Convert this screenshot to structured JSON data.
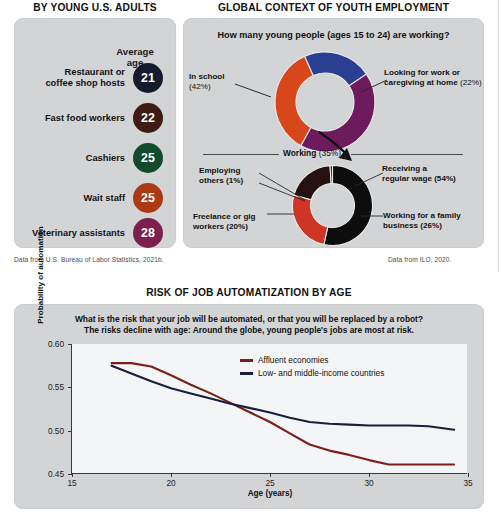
{
  "panels": {
    "left": {
      "title": "BY YOUNG U.S. ADULTS",
      "column_header": "Average\nage",
      "column_header_line1": "Average",
      "column_header_line2": "age",
      "rows": [
        {
          "label": "Restaurant or coffee shop hosts",
          "label_line1": "Restaurant or",
          "label_line2": "coffee shop hosts",
          "age": "21",
          "color": "#161a2e"
        },
        {
          "label": "Fast food workers",
          "label_line1": "Fast food workers",
          "label_line2": "",
          "age": "22",
          "color": "#3d1c12"
        },
        {
          "label": "Cashiers",
          "label_line1": "Cashiers",
          "label_line2": "",
          "age": "25",
          "color": "#124a2b"
        },
        {
          "label": "Wait staff",
          "label_line1": "Wait staff",
          "label_line2": "",
          "age": "25",
          "color": "#ab3a14"
        },
        {
          "label": "Veterinary assistants",
          "label_line1": "Veterinary assistants",
          "label_line2": "",
          "age": "28",
          "color": "#7c1f4d"
        }
      ],
      "source": "Data from U.S. Bureau of Labor Statistics, 2021b."
    },
    "right": {
      "title": "GLOBAL CONTEXT OF YOUTH EMPLOYMENT",
      "question": "How many young people (ages 15 to 24) are working?",
      "source": "Data from ILO, 2020.",
      "connector_label_bold": "Working",
      "connector_label_pct": "(35%)",
      "donut_top": {
        "type": "pie",
        "title": "How many young people (ages 15 to 24) are working?",
        "slices": [
          {
            "label": "In school",
            "pct_text": "(42%)",
            "value": 42,
            "color": "#6d1b5c"
          },
          {
            "label": "Looking for work or caregiving at home",
            "pct_text": "(22%)",
            "value": 22,
            "color": "#2b3f92"
          },
          {
            "label": "Working",
            "pct_text": "(35%)",
            "value": 35,
            "color": "#d8471b"
          }
        ]
      },
      "donut_bottom": {
        "type": "pie",
        "title": "Working (35%)",
        "slices": [
          {
            "label": "Receiving a regular wage",
            "pct_text": "(54%)",
            "value": 54,
            "color": "#0d0d0d"
          },
          {
            "label": "Working for a family business",
            "pct_text": "(26%)",
            "value": 26,
            "color": "#cf3525"
          },
          {
            "label": "Freelance or gig workers",
            "pct_text": "(20%)",
            "value": 20,
            "color": "#241210"
          },
          {
            "label": "Employing others",
            "pct_text": "(1%)",
            "value": 1,
            "color": "#5a1a14"
          }
        ]
      },
      "labels": {
        "in_school_l1": "In school",
        "in_school_l2": "(42%)",
        "looking_l1": "Looking for work or",
        "looking_l2": "caregiving at home",
        "looking_pct": "(22%)",
        "employing_l1": "Employing",
        "employing_l2": "others (1%)",
        "receiving_l1": "Receiving a",
        "receiving_l2": "regular wage (54%)",
        "freelance_l1": "Freelance or gig",
        "freelance_l2": "workers (20%)",
        "family_l1": "Working for a family",
        "family_l2": "business (26%)"
      }
    },
    "bottom": {
      "title": "RISK OF JOB AUTOMATIZATION BY AGE",
      "subtitle_line1": "What is the risk that your job will be automated, or that you will be replaced by a robot?",
      "subtitle_line2": "The risks decline with age: Around the globe, young people's jobs are most at risk."
    }
  },
  "chart_data": {
    "type": "line",
    "title": "RISK OF JOB AUTOMATIZATION BY AGE",
    "subtitle": "What is the risk that your job will be automated, or that you will be replaced by a robot? The risks decline with age: Around the globe, young people's jobs are most at risk.",
    "xlabel": "Age (years)",
    "ylabel": "Probability of automation",
    "xlim": [
      15,
      35
    ],
    "ylim": [
      0.45,
      0.6
    ],
    "xticks": [
      15,
      20,
      25,
      30,
      35
    ],
    "xtick_labels": [
      "15",
      "20",
      "25",
      "30",
      "35"
    ],
    "yticks": [
      0.45,
      0.5,
      0.55,
      0.6
    ],
    "ytick_labels": [
      "0.45",
      "0.50",
      "0.55",
      "0.60"
    ],
    "grid": false,
    "legend_position": "upper right",
    "series": [
      {
        "name": "Affluent economies",
        "color": "#7a2018",
        "x": [
          17.0,
          18.0,
          19.0,
          20.0,
          21.0,
          22.0,
          23.0,
          24.0,
          25.0,
          26.0,
          27.0,
          28.0,
          29.0,
          30.0,
          31.0,
          32.0,
          33.0,
          34.3
        ],
        "values": [
          0.578,
          0.578,
          0.574,
          0.564,
          0.553,
          0.543,
          0.532,
          0.521,
          0.51,
          0.497,
          0.484,
          0.477,
          0.472,
          0.466,
          0.461,
          0.461,
          0.461,
          0.461
        ]
      },
      {
        "name": "Low- and middle-income countries",
        "color": "#17203d",
        "x": [
          17.0,
          18.0,
          19.0,
          20.0,
          21.0,
          22.0,
          23.0,
          24.0,
          25.0,
          26.0,
          27.0,
          28.0,
          29.0,
          30.0,
          31.0,
          32.0,
          33.0,
          34.3
        ],
        "values": [
          0.575,
          0.566,
          0.557,
          0.549,
          0.543,
          0.537,
          0.531,
          0.526,
          0.521,
          0.515,
          0.51,
          0.508,
          0.507,
          0.506,
          0.506,
          0.506,
          0.505,
          0.501
        ]
      }
    ]
  }
}
